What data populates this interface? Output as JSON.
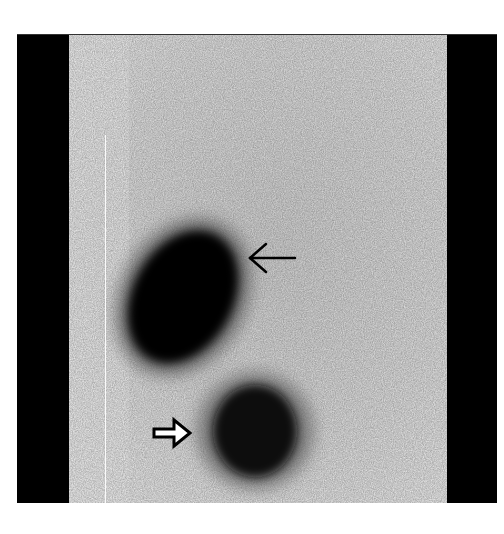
{
  "image": {
    "type": "planar scintigraphy (grayscale)",
    "background_color": "#ffffff",
    "frame_color": "#000000",
    "field_color": "#eeeeee",
    "uptake_color": "#000000"
  },
  "regions": [
    {
      "name": "upper-elongated-uptake",
      "shape": "oblique oval, kidney-like",
      "intensity": "high"
    },
    {
      "name": "lower-round-uptake",
      "shape": "round/oval, mottled",
      "intensity": "high"
    }
  ],
  "annotations": [
    {
      "name": "thin-arrow",
      "style": "open line arrow",
      "direction": "left",
      "points_to": "upper-elongated-uptake"
    },
    {
      "name": "outline-arrowhead",
      "style": "hollow block arrow",
      "direction": "right",
      "points_to": "lower-round-uptake"
    }
  ]
}
